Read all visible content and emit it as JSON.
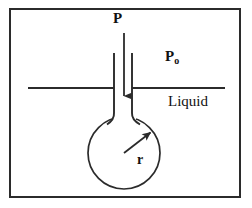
{
  "figure": {
    "type": "physics-diagram",
    "canvas": {
      "width": 252,
      "height": 208
    },
    "background_color": "#ffffff",
    "stroke_color": "#2b2b2b",
    "text_color": "#111111"
  },
  "border": {
    "name": "figure-frame",
    "x": 9,
    "y": 8,
    "width": 231,
    "height": 189,
    "stroke_width": 2
  },
  "labels": {
    "applied_pressure": "P",
    "ambient_pressure_symbol": "P",
    "ambient_pressure_subscript": "o",
    "medium": "Liquid",
    "radius": "r"
  },
  "elements": {
    "pressure_arrow": {
      "name": "downward-pressure-arrow",
      "x": 124,
      "y_start": 33,
      "y_end": 103,
      "direction": "down"
    },
    "capillary_tube": {
      "name": "capillary-tube",
      "left_wall_x": 114,
      "right_wall_x": 132,
      "y_top": 53,
      "y_bottom": 122
    },
    "liquid_surface": {
      "name": "liquid-surface-line",
      "x_start": 28,
      "x_end": 225,
      "y": 88
    },
    "bubble": {
      "name": "spherical-bubble",
      "center_x": 124,
      "center_y": 153,
      "radius": 36
    },
    "radius_arrow": {
      "name": "radius-arrow",
      "x_start": 124,
      "y_start": 153,
      "x_end": 152,
      "y_end": 131
    }
  }
}
